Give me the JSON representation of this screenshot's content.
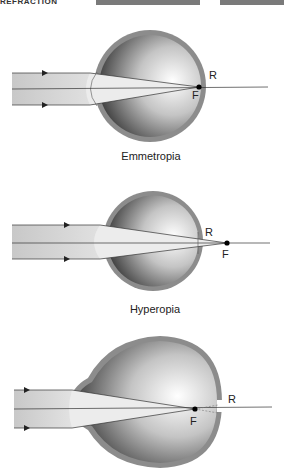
{
  "header": {
    "text": "REFRACTION",
    "bars": [
      {
        "left": 96,
        "width": 104
      },
      {
        "left": 220,
        "width": 64
      }
    ]
  },
  "panels": [
    {
      "id": "emmetropia",
      "caption": "Emmetropia",
      "retina_label": "R",
      "focus_label": "F"
    },
    {
      "id": "hyperopia",
      "caption": "Hyperopia",
      "retina_label": "R",
      "focus_label": "F"
    },
    {
      "id": "myopia",
      "caption": "",
      "retina_label": "R",
      "focus_label": "F"
    }
  ],
  "colors": {
    "sclera": "#8c8c8c",
    "beam": "#d6d6d6",
    "line": "#333333",
    "focus": "#000000"
  }
}
